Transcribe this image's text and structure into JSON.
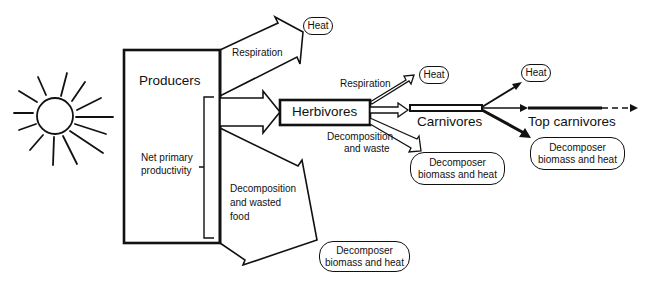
{
  "diagram": {
    "type": "energy-flow",
    "nodes": {
      "producers": "Producers",
      "herbivores": "Herbivores",
      "carnivores": "Carnivores",
      "top_carnivores": "Top carnivores"
    },
    "labels": {
      "respiration_producers": "Respiration",
      "net_primary_line1": "Net primary",
      "net_primary_line2": "productivity",
      "decomp_food_line1": "Decomposition",
      "decomp_food_line2": "and wasted",
      "decomp_food_line3": "food",
      "respiration_herbivores": "Respiration",
      "decomp_waste_line1": "Decomposition",
      "decomp_waste_line2": "and waste"
    },
    "outputs": {
      "heat_1": "Heat",
      "heat_2": "Heat",
      "heat_3": "Heat",
      "decomposer_1_line1": "Decomposer",
      "decomposer_1_line2": "biomass and heat",
      "decomposer_2_line1": "Decomposer",
      "decomposer_2_line2": "biomass and heat",
      "decomposer_3_line1": "Decomposer",
      "decomposer_3_line2": "biomass and heat"
    }
  }
}
